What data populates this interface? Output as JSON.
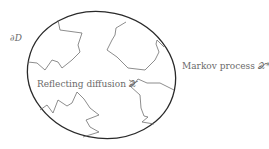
{
  "diagram": {
    "boundary_label": "∂D",
    "inner_label": "Reflecting diffusion 𝒳",
    "outer_label": "Markov process 𝒳*",
    "colors": {
      "boundary_stroke": "#2a2a2a",
      "path_stroke": "#707070",
      "text": "#6a6a6a"
    },
    "domain_ellipse": {
      "cx": 101.5,
      "cy": 75,
      "rx": 74.5,
      "ry": 63,
      "rotate": 12
    },
    "paths": [
      {
        "name": "path-top-left",
        "points": "58,20 60,30 82,33 78,45 80,52 72,60 62,68 58,62 52,60 45,70 37,63 28,62"
      },
      {
        "name": "path-top-right",
        "points": "126,22 116,28 115,35 112,40 107,50 117,57 128,68 145,70 155,60 159,52 156,44 157,40 164,47"
      },
      {
        "name": "path-bottom-left",
        "points": "40,110 47,105 53,113 58,100 67,106 72,103 77,92 84,99 90,108 99,115 86,120 90,127 99,132 83,137"
      },
      {
        "name": "path-bottom-right",
        "points": "129,80 135,83 138,79 147,83 160,83 168,87 174,90"
      },
      {
        "name": "path-bottom-right-branch",
        "points": "135,83 130,86 140,95 141,108 144,116 148,117 142,122 154,124"
      }
    ]
  }
}
